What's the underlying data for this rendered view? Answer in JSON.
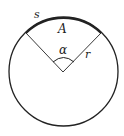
{
  "diagram": {
    "type": "circle-sector",
    "labels": {
      "arc": "s",
      "area": "A",
      "angle": "α",
      "radius": "r"
    },
    "colors": {
      "stroke": "#222222",
      "background": "#ffffff"
    }
  }
}
